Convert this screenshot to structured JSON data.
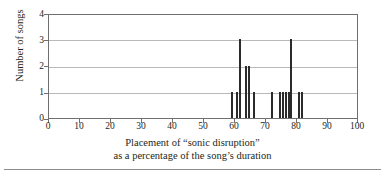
{
  "chart_data": {
    "type": "bar",
    "title": "",
    "subtitle": "",
    "xlabel_line1": "Placement of “sonic disruption”",
    "xlabel_line2": "as a percentage of the song’s duration",
    "ylabel": "Number of songs",
    "xlim": [
      0,
      100
    ],
    "ylim": [
      0,
      4
    ],
    "xticks": [
      0,
      10,
      20,
      30,
      40,
      50,
      60,
      70,
      80,
      90,
      100
    ],
    "xtick_labels": [
      "0",
      "10",
      "20",
      "30",
      "40",
      "50",
      "60",
      "70",
      "80",
      "90",
      "100"
    ],
    "yticks": [
      0,
      1,
      2,
      3,
      4
    ],
    "ytick_labels": [
      "0",
      "1",
      "2",
      "3",
      "4"
    ],
    "grid": "horizontal",
    "legend": "none",
    "bar_color": "#2b2b2b",
    "bar_width_units": 0.6,
    "x": [
      59,
      60.5,
      61.5,
      63.5,
      64.5,
      66,
      72,
      74.5,
      75.5,
      76.5,
      77.5,
      78,
      80.5,
      81.5
    ],
    "values": [
      1,
      1,
      3,
      2,
      2,
      1,
      1,
      1,
      1,
      1,
      1,
      3,
      1,
      1
    ],
    "categories": [
      "59",
      "60.5",
      "61.5",
      "63.5",
      "64.5",
      "66",
      "72",
      "74.5",
      "75.5",
      "76.5",
      "77.5",
      "78",
      "80.5",
      "81.5"
    ]
  },
  "figure": {
    "axis_color": "#6f6f6f",
    "grid_color": "#b9b9b9",
    "text_color": "#231f20",
    "background": "#ffffff",
    "bottom_rule_color": "#8c8c8c"
  }
}
